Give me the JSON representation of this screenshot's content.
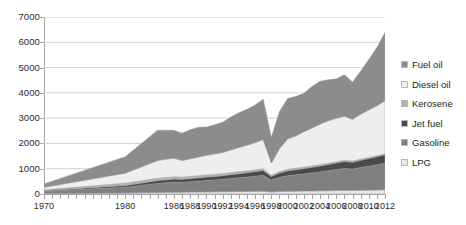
{
  "chart_data": {
    "type": "area",
    "stacked": true,
    "title": "",
    "subtitle": "",
    "xlabel": "",
    "ylabel": "",
    "xlim": [
      1970,
      2012
    ],
    "ylim": [
      0,
      7000
    ],
    "ytick_labels": [
      "0",
      "1000",
      "2000",
      "3000",
      "4000",
      "5000",
      "6000",
      "7000"
    ],
    "ytick_values": [
      0,
      1000,
      2000,
      3000,
      4000,
      5000,
      6000,
      7000
    ],
    "xtick_labels": [
      "1970",
      "1980",
      "1986",
      "1988",
      "1990",
      "1992",
      "1994",
      "1996",
      "1998",
      "2000",
      "2002",
      "2004",
      "2006",
      "2008",
      "2010",
      "2012"
    ],
    "xtick_values": [
      1970,
      1980,
      1986,
      1988,
      1990,
      1992,
      1994,
      1996,
      1998,
      2000,
      2002,
      2004,
      2006,
      2008,
      2010,
      2012
    ],
    "grid": true,
    "grid_axis": "y",
    "legend_position": "right",
    "x": [
      1970,
      1980,
      1984,
      1985,
      1986,
      1987,
      1988,
      1989,
      1990,
      1991,
      1992,
      1993,
      1994,
      1995,
      1996,
      1997,
      1998,
      1999,
      2000,
      2001,
      2002,
      2003,
      2004,
      2005,
      2006,
      2007,
      2008,
      2009,
      2010,
      2011,
      2012
    ],
    "series": [
      {
        "name": "LPG",
        "color": "#e8e8e8",
        "values": [
          15,
          40,
          60,
          65,
          70,
          72,
          75,
          78,
          82,
          85,
          88,
          92,
          96,
          100,
          105,
          110,
          80,
          95,
          105,
          110,
          115,
          120,
          125,
          130,
          135,
          140,
          138,
          145,
          152,
          158,
          165
        ]
      },
      {
        "name": "Gasoline",
        "color": "#7f7f7f",
        "values": [
          90,
          230,
          360,
          380,
          400,
          390,
          410,
          430,
          450,
          470,
          490,
          520,
          545,
          570,
          600,
          630,
          470,
          560,
          620,
          650,
          680,
          715,
          750,
          790,
          830,
          870,
          850,
          900,
          950,
          1000,
          1050
        ]
      },
      {
        "name": "Jet fuel",
        "color": "#4a4a4a",
        "values": [
          25,
          70,
          110,
          115,
          120,
          118,
          124,
          130,
          136,
          142,
          148,
          156,
          164,
          172,
          182,
          192,
          145,
          172,
          190,
          200,
          210,
          222,
          234,
          248,
          262,
          276,
          270,
          286,
          302,
          318,
          335
        ]
      },
      {
        "name": "Kerosene",
        "color": "#b4b4b4",
        "values": [
          35,
          85,
          95,
          92,
          90,
          86,
          84,
          82,
          80,
          78,
          76,
          74,
          72,
          70,
          68,
          66,
          50,
          58,
          60,
          58,
          56,
          54,
          52,
          50,
          48,
          46,
          44,
          42,
          40,
          38,
          36
        ]
      },
      {
        "name": "Diesel oil",
        "color": "#eeeeee",
        "values": [
          100,
          400,
          700,
          720,
          740,
          660,
          700,
          740,
          780,
          810,
          840,
          900,
          960,
          1020,
          1080,
          1150,
          480,
          900,
          1200,
          1280,
          1400,
          1500,
          1600,
          1680,
          1720,
          1740,
          1650,
          1780,
          1880,
          1980,
          2100
        ]
      },
      {
        "name": "Fuel oil",
        "color": "#8c8c8c",
        "values": [
          135,
          650,
          1200,
          1150,
          1100,
          1080,
          1150,
          1180,
          1120,
          1150,
          1200,
          1300,
          1380,
          1420,
          1480,
          1600,
          1020,
          1480,
          1600,
          1560,
          1520,
          1640,
          1700,
          1620,
          1560,
          1640,
          1480,
          1700,
          2000,
          2300,
          2700
        ]
      }
    ],
    "totals_note": "Stacked totals rise from about 400 in 1970 to about 6500 in 2012, with a sharp dip to about 2250 in 1998.",
    "legend_order_top_to_bottom": [
      "Fuel oil",
      "Diesel oil",
      "Kerosene",
      "Jet fuel",
      "Gasoline",
      "LPG"
    ]
  },
  "legend": {
    "items": [
      {
        "label": "Fuel oil",
        "color": "#8c8c8c"
      },
      {
        "label": "Diesel oil",
        "color": "#eeeeee"
      },
      {
        "label": "Kerosene",
        "color": "#b4b4b4"
      },
      {
        "label": "Jet fuel",
        "color": "#4a4a4a"
      },
      {
        "label": "Gasoline",
        "color": "#7f7f7f"
      },
      {
        "label": "LPG",
        "color": "#e8e8e8"
      }
    ]
  },
  "style": {
    "axis_color": "#a6a6a6",
    "grid_color": "#d4d4d4",
    "text_color": "#2b2b2b",
    "background": "#ffffff"
  }
}
